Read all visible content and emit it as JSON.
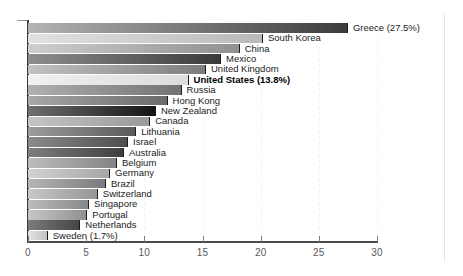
{
  "chart_data": {
    "type": "bar",
    "orientation": "horizontal",
    "title": "",
    "subtitle": "",
    "xlabel": "",
    "ylabel": "",
    "xlim": [
      0,
      30
    ],
    "xticks": [
      0,
      5,
      10,
      15,
      20,
      25,
      30
    ],
    "xtick_labels": [
      "0",
      "5",
      "10",
      "15",
      "20",
      "25",
      "30"
    ],
    "grid": true,
    "grid_axis": "x",
    "legend": "none",
    "highlight_category": "United States",
    "categories": [
      "Greece",
      "South Korea",
      "China",
      "Mexico",
      "United Kingdom",
      "United States",
      "Russia",
      "Hong Kong",
      "New Zealand",
      "Canada",
      "Lithuania",
      "Israel",
      "Australia",
      "Belgium",
      "Germany",
      "Brazil",
      "Switzerland",
      "Singapore",
      "Portugal",
      "Netherlands",
      "Sweden"
    ],
    "values": [
      27.5,
      20.2,
      18.2,
      16.6,
      15.3,
      13.8,
      13.2,
      12.0,
      11.0,
      10.5,
      9.3,
      8.6,
      8.25,
      7.65,
      7.05,
      6.7,
      6.0,
      5.25,
      5.1,
      4.5,
      1.7
    ],
    "bars": [
      {
        "label": "Greece (27.5%)",
        "name": "Greece",
        "value": 27.5,
        "highlight": false,
        "fill_left": "#b4b4b4",
        "fill_right": "#3c3c3c"
      },
      {
        "label": "South Korea",
        "name": "South Korea",
        "value": 20.2,
        "highlight": false,
        "fill_left": "#e2e2e2",
        "fill_right": "#b9b9b9"
      },
      {
        "label": "China",
        "name": "China",
        "value": 18.2,
        "highlight": false,
        "fill_left": "#cfcfcf",
        "fill_right": "#8f8f8f"
      },
      {
        "label": "Mexico",
        "name": "Mexico",
        "value": 16.6,
        "highlight": false,
        "fill_left": "#8e8e8e",
        "fill_right": "#3a3a3a"
      },
      {
        "label": "United Kingdom",
        "name": "United Kingdom",
        "value": 15.3,
        "highlight": false,
        "fill_left": "#c2c2c2",
        "fill_right": "#7c7c7c"
      },
      {
        "label": "United States (13.8%)",
        "name": "United States",
        "value": 13.8,
        "highlight": true,
        "fill_left": "#f0f0f0",
        "fill_right": "#dcdcdc"
      },
      {
        "label": "Russia",
        "name": "Russia",
        "value": 13.2,
        "highlight": false,
        "fill_left": "#b0b0b0",
        "fill_right": "#727272"
      },
      {
        "label": "Hong Kong",
        "name": "Hong Kong",
        "value": 12.0,
        "highlight": false,
        "fill_left": "#a8a8a8",
        "fill_right": "#6a6a6a"
      },
      {
        "label": "New Zealand",
        "name": "New Zealand",
        "value": 11.0,
        "highlight": false,
        "fill_left": "#6f6f6f",
        "fill_right": "#141414"
      },
      {
        "label": "Canada",
        "name": "Canada",
        "value": 10.5,
        "highlight": false,
        "fill_left": "#c4c4c4",
        "fill_right": "#9a9a9a"
      },
      {
        "label": "Lithuania",
        "name": "Lithuania",
        "value": 9.3,
        "highlight": false,
        "fill_left": "#9c9c9c",
        "fill_right": "#5a5a5a"
      },
      {
        "label": "Israel",
        "name": "Israel",
        "value": 8.6,
        "highlight": false,
        "fill_left": "#8a8a8a",
        "fill_right": "#4e4e4e"
      },
      {
        "label": "Australia",
        "name": "Australia",
        "value": 8.25,
        "highlight": false,
        "fill_left": "#7e7e7e",
        "fill_right": "#3f3f3f"
      },
      {
        "label": "Belgium",
        "name": "Belgium",
        "value": 7.65,
        "highlight": false,
        "fill_left": "#bdbdbd",
        "fill_right": "#848484"
      },
      {
        "label": "Germany",
        "name": "Germany",
        "value": 7.05,
        "highlight": false,
        "fill_left": "#d2d2d2",
        "fill_right": "#a6a6a6"
      },
      {
        "label": "Brazil",
        "name": "Brazil",
        "value": 6.7,
        "highlight": false,
        "fill_left": "#b6b6b6",
        "fill_right": "#7a7a7a"
      },
      {
        "label": "Switzerland",
        "name": "Switzerland",
        "value": 6.0,
        "highlight": false,
        "fill_left": "#c8c8c8",
        "fill_right": "#959595"
      },
      {
        "label": "Singapore",
        "name": "Singapore",
        "value": 5.25,
        "highlight": false,
        "fill_left": "#bcbcbc",
        "fill_right": "#888888"
      },
      {
        "label": "Portugal",
        "name": "Portugal",
        "value": 5.1,
        "highlight": false,
        "fill_left": "#c6c6c6",
        "fill_right": "#909090"
      },
      {
        "label": "Netherlands",
        "name": "Netherlands",
        "value": 4.5,
        "highlight": false,
        "fill_left": "#7b7b7b",
        "fill_right": "#454545"
      },
      {
        "label": "Sweden (1.7%)",
        "name": "Sweden",
        "value": 1.7,
        "highlight": false,
        "fill_left": "#e4e4e4",
        "fill_right": "#c2c2c2"
      }
    ]
  },
  "colors": {
    "background": "#ffffff",
    "axis": "#3b3b3b",
    "tick_label": "#58585a",
    "grid": "#f2f2f2",
    "bar_outline": "#1d1d1d",
    "label_text": "#1b1b1b"
  }
}
